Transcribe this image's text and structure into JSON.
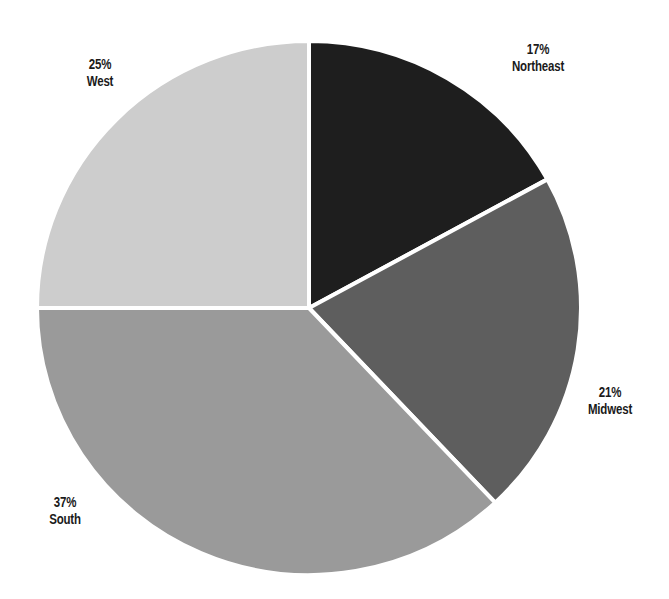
{
  "chart_data": {
    "type": "pie",
    "title": "",
    "start_angle": "12 o'clock",
    "direction": "clockwise",
    "categories": [
      "Northeast",
      "Midwest",
      "South",
      "West"
    ],
    "values": [
      17,
      21,
      37,
      25
    ],
    "unit": "%",
    "colors": [
      "#1e1e1e",
      "#5e5e5e",
      "#9a9a9a",
      "#cdcdcd"
    ],
    "separator_color": "#ffffff",
    "legend": "none (labels placed beside slices)",
    "slices": [
      {
        "name": "Northeast",
        "value": 17,
        "pct_label": "17%",
        "color": "#1e1e1e"
      },
      {
        "name": "Midwest",
        "value": 21,
        "pct_label": "21%",
        "color": "#5e5e5e"
      },
      {
        "name": "South",
        "value": 37,
        "pct_label": "37%",
        "color": "#9a9a9a"
      },
      {
        "name": "West",
        "value": 25,
        "pct_label": "25%",
        "color": "#cdcdcd"
      }
    ]
  },
  "labels": {
    "northeast": {
      "pct": "17%",
      "name": "Northeast"
    },
    "midwest": {
      "pct": "21%",
      "name": "Midwest"
    },
    "south": {
      "pct": "37%",
      "name": "South"
    },
    "west": {
      "pct": "25%",
      "name": "West"
    }
  }
}
